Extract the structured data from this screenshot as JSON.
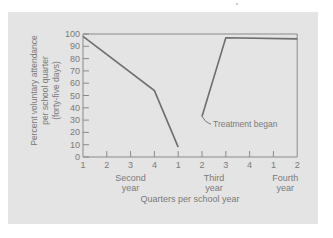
{
  "chart_data": {
    "type": "line",
    "title": "",
    "xlabel": "Quarters per school year",
    "ylabel": "Percent voluntary attendance per school quarter (forty-five days)",
    "ylabel_lines": [
      "Percent voluntary attendance",
      "per school quarter",
      "(forty-five days)"
    ],
    "ylim": [
      0,
      100
    ],
    "yticks": [
      0,
      10,
      20,
      30,
      40,
      50,
      60,
      70,
      80,
      90,
      100
    ],
    "x_tick_labels": [
      "1",
      "2",
      "3",
      "4",
      "1",
      "2",
      "3",
      "4",
      "1",
      "2"
    ],
    "year_labels": [
      {
        "line1": "Second",
        "line2": "year",
        "under_tick_index": 2
      },
      {
        "line1": "Third",
        "line2": "year",
        "under_tick_index": 5.5
      },
      {
        "line1": "Fourth",
        "line2": "year",
        "under_tick_index": 8.5
      }
    ],
    "grid": false,
    "series": [
      {
        "name": "Before treatment",
        "x_index": [
          0,
          3,
          4
        ],
        "values": [
          98,
          54,
          8
        ]
      },
      {
        "name": "After treatment",
        "x_index": [
          5,
          6,
          9
        ],
        "values": [
          33,
          97,
          96
        ]
      }
    ],
    "annotations": [
      {
        "text": "Treatment began",
        "x_index": 5,
        "y": 33
      }
    ],
    "colors": {
      "panel": "#e4e4e4",
      "line": "#6e6e6e",
      "axis": "#8a8a8a",
      "text": "#7a7a7a"
    }
  }
}
